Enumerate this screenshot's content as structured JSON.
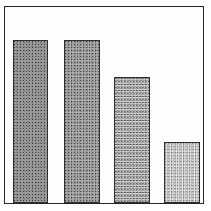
{
  "figure": {
    "background_color": "#ffffff",
    "frame_color": "#262626",
    "frame_visible": true,
    "width": 211,
    "height": 211
  },
  "chart_data": {
    "type": "bar",
    "title": "",
    "subtitle": "",
    "xlabel": "",
    "ylabel": "",
    "categories": [
      "1",
      "2",
      "3",
      "4"
    ],
    "values": [
      100,
      100,
      77,
      38
    ],
    "ylim": [
      0,
      110
    ],
    "xlim": [
      0,
      4
    ],
    "grid": false,
    "legend": null,
    "legend_position": "none",
    "tick_labels_x": [],
    "tick_labels_y": [],
    "annotations": [],
    "bar_edge_color": "#30302f",
    "bar_fill_colors": [
      "#8e8e8c",
      "#9a9a98",
      "#a8a8a6",
      "#c4c4c2"
    ],
    "bar_fill_styles": [
      "dark-dither",
      "mediumdark-dither",
      "medium-dither",
      "light-dither"
    ],
    "bars": [
      {
        "name": "bar-1",
        "value": 100,
        "left_px": 13,
        "width_px": 35,
        "top_px": 39,
        "shade": "dark"
      },
      {
        "name": "bar-2",
        "value": 100,
        "left_px": 64,
        "width_px": 36,
        "top_px": 39,
        "shade": "mediumdark"
      },
      {
        "name": "bar-3",
        "value": 77,
        "left_px": 114,
        "width_px": 36,
        "top_px": 76,
        "shade": "medium"
      },
      {
        "name": "bar-4",
        "value": 38,
        "left_px": 164,
        "width_px": 36,
        "top_px": 141,
        "shade": "light"
      }
    ]
  }
}
